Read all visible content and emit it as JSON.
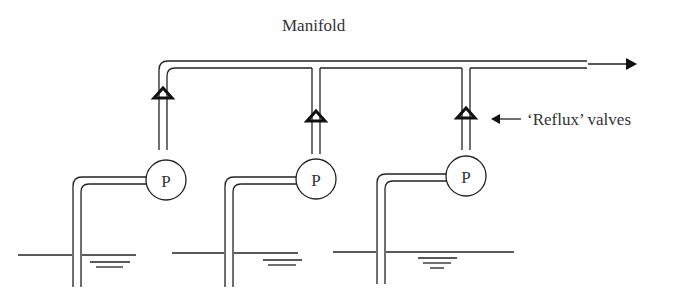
{
  "diagram": {
    "title_label": "Manifold",
    "valve_label": "‘Reflux’ valves",
    "pump_label": "P",
    "pumps": [
      {
        "id": 1,
        "label": "P"
      },
      {
        "id": 2,
        "label": "P"
      },
      {
        "id": 3,
        "label": "P"
      }
    ],
    "colors": {
      "line": "#222222",
      "background": "#ffffff"
    }
  }
}
